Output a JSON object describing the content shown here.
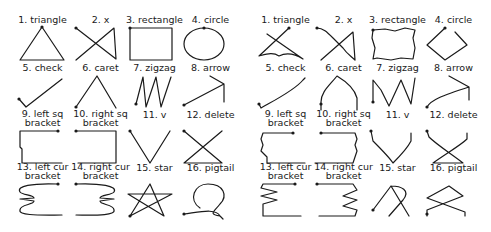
{
  "figure": {
    "panels": [
      {
        "id": "left",
        "variant": "templates",
        "gestures": [
          {
            "label_lines": [
              "1. triangle"
            ]
          },
          {
            "label_lines": [
              "2. x"
            ]
          },
          {
            "label_lines": [
              "3. rectangle"
            ]
          },
          {
            "label_lines": [
              "4. circle"
            ]
          },
          {
            "label_lines": [
              "5. check"
            ]
          },
          {
            "label_lines": [
              "6. caret"
            ]
          },
          {
            "label_lines": [
              "7. zigzag"
            ]
          },
          {
            "label_lines": [
              "8. arrow"
            ]
          },
          {
            "label_lines": [
              "9. left sq",
              "bracket"
            ]
          },
          {
            "label_lines": [
              "10. right sq",
              "bracket"
            ]
          },
          {
            "label_lines": [
              "11. v"
            ]
          },
          {
            "label_lines": [
              "12. delete"
            ]
          },
          {
            "label_lines": [
              "13. left cur",
              "bracket"
            ]
          },
          {
            "label_lines": [
              "14. right cur",
              "bracket"
            ]
          },
          {
            "label_lines": [
              "15. star"
            ]
          },
          {
            "label_lines": [
              "16. pigtail"
            ]
          }
        ]
      },
      {
        "id": "right",
        "variant": "samples",
        "gestures": [
          {
            "label_lines": [
              "1. triangle"
            ]
          },
          {
            "label_lines": [
              "2. x"
            ]
          },
          {
            "label_lines": [
              "3. rectangle"
            ]
          },
          {
            "label_lines": [
              "4. circle"
            ]
          },
          {
            "label_lines": [
              "5. check"
            ]
          },
          {
            "label_lines": [
              "6. caret"
            ]
          },
          {
            "label_lines": [
              "7. zigzag"
            ]
          },
          {
            "label_lines": [
              "8. arrow"
            ]
          },
          {
            "label_lines": [
              "9. left sq",
              "bracket"
            ]
          },
          {
            "label_lines": [
              "10. right sq",
              "bracket"
            ]
          },
          {
            "label_lines": [
              "11. v"
            ]
          },
          {
            "label_lines": [
              "12. delete"
            ]
          },
          {
            "label_lines": [
              "13. left cur",
              "bracket"
            ]
          },
          {
            "label_lines": [
              "14. right cur",
              "bracket"
            ]
          },
          {
            "label_lines": [
              "15. star"
            ]
          },
          {
            "label_lines": [
              "16. pigtail"
            ]
          }
        ]
      }
    ],
    "stroke_color": "#1a1a1a"
  }
}
